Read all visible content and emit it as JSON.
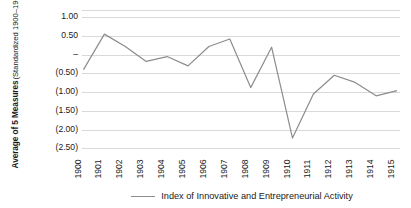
{
  "chart_data": {
    "type": "line",
    "title": "",
    "xlabel": "",
    "ylabel": "Average of 5 Measures",
    "ylabel_sub": "(Standardized 1900–1905)",
    "categories": [
      "1900",
      "1901",
      "1902",
      "1903",
      "1904",
      "1905",
      "1906",
      "1907",
      "1908",
      "1909",
      "1910",
      "1911",
      "1912",
      "1913",
      "1914",
      "1915"
    ],
    "series": [
      {
        "name": "Index of Innovative and Entrepreneurial Activity",
        "color": "#8c8c8c",
        "values": [
          -0.4,
          0.55,
          0.22,
          -0.18,
          -0.05,
          -0.3,
          0.22,
          0.42,
          -0.88,
          0.2,
          -2.23,
          -1.05,
          -0.55,
          -0.74,
          -1.1,
          -0.96
        ]
      }
    ],
    "ylim": [
      -2.5,
      1.0
    ],
    "ytick_values": [
      1.0,
      0.5,
      0.0,
      -0.5,
      -1.0,
      -1.5,
      -2.0,
      -2.5
    ],
    "ytick_labels": [
      "1.00",
      "0.50",
      "–",
      "(0.50)",
      "(1.00)",
      "(1.50)",
      "(2.00)",
      "(2.50)"
    ],
    "grid": true,
    "grid_color": "#d9d9d9",
    "legend_position": "bottom",
    "legend_entries": [
      "Index of Innovative and Entrepreneurial Activity"
    ]
  },
  "legend": {
    "label": "Index of Innovative and Entrepreneurial Activity"
  }
}
